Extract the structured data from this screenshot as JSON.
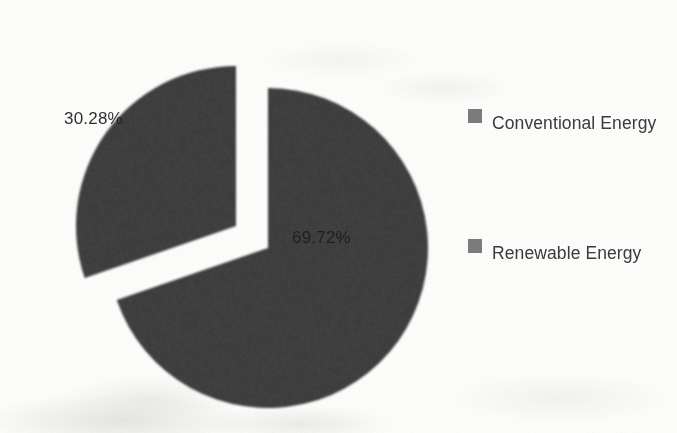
{
  "chart_data": {
    "type": "pie",
    "title": "",
    "categories": [
      "Conventional Energy",
      "Renewable Energy"
    ],
    "values": [
      30.28,
      69.72
    ],
    "unit": "%",
    "data_labels": [
      "30.28%",
      "69.72%"
    ],
    "legend": {
      "position": "right",
      "entries": [
        {
          "label": "Conventional Energy",
          "color": "#7c7c7c",
          "value": 30.28,
          "data_label": "30.28%",
          "exploded": true
        },
        {
          "label": "Renewable Energy",
          "color": "#7c7c7c",
          "value": 69.72,
          "data_label": "69.72%",
          "exploded": false
        }
      ]
    },
    "grid": false,
    "slice_color": "#7c7c7c",
    "label_color": "#1d1d1d",
    "background": "#fdfdfc"
  },
  "labels": {
    "conventional_pct": "30.28%",
    "renewable_pct": "69.72%"
  },
  "legend": {
    "conventional": "Conventional Energy",
    "renewable": "Renewable Energy"
  }
}
